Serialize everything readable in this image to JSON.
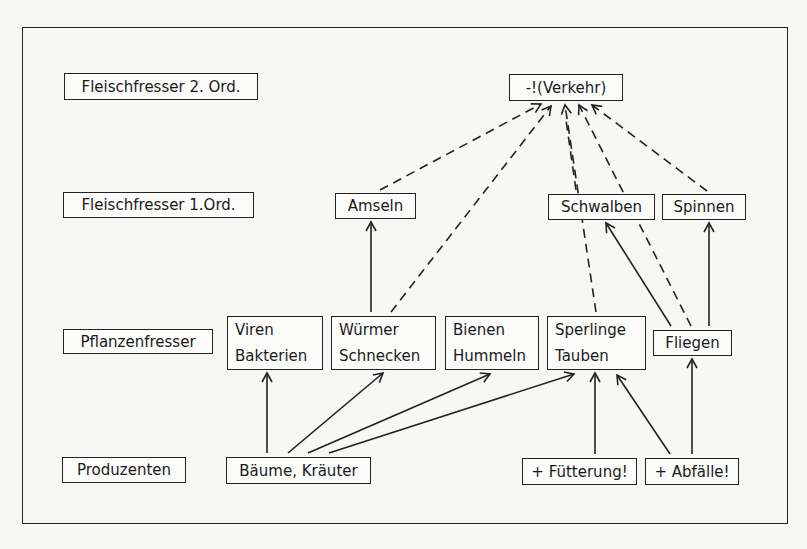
{
  "diagram": {
    "type": "food-web",
    "levels": [
      {
        "id": "lvl2",
        "label": "Fleischfresser 2. Ord."
      },
      {
        "id": "lvl1",
        "label": "Fleischfresser 1.Ord."
      },
      {
        "id": "lvl_herb",
        "label": "Pflanzenfresser"
      },
      {
        "id": "lvl_prod",
        "label": "Produzenten"
      }
    ],
    "nodes": {
      "verkehr": {
        "label": "-!(Verkehr)"
      },
      "amseln": {
        "label": "Amseln"
      },
      "schwalben": {
        "label": "Schwalben"
      },
      "spinnen": {
        "label": "Spinnen"
      },
      "viren": {
        "line1": "Viren",
        "line2": "Bakterien"
      },
      "wuermer": {
        "line1": "Würmer",
        "line2": "Schnecken"
      },
      "bienen": {
        "line1": "Bienen",
        "line2": "Hummeln"
      },
      "sperlinge": {
        "line1": "Sperlinge",
        "line2": "Tauben"
      },
      "fliegen": {
        "label": "Fliegen"
      },
      "baeume": {
        "label": "Bäume, Kräuter"
      },
      "fuetterung": {
        "label": "+ Fütterung!"
      },
      "abfaelle": {
        "label": "+ Abfälle!"
      }
    },
    "edges": [
      {
        "from": "baeume",
        "to": "viren",
        "style": "solid"
      },
      {
        "from": "baeume",
        "to": "wuermer",
        "style": "solid"
      },
      {
        "from": "baeume",
        "to": "bienen",
        "style": "solid"
      },
      {
        "from": "baeume",
        "to": "sperlinge",
        "style": "solid"
      },
      {
        "from": "fuetterung",
        "to": "sperlinge",
        "style": "solid"
      },
      {
        "from": "abfaelle",
        "to": "sperlinge",
        "style": "solid"
      },
      {
        "from": "abfaelle",
        "to": "fliegen",
        "style": "solid"
      },
      {
        "from": "wuermer",
        "to": "amseln",
        "style": "solid"
      },
      {
        "from": "fliegen",
        "to": "schwalben",
        "style": "solid"
      },
      {
        "from": "fliegen",
        "to": "spinnen",
        "style": "solid"
      },
      {
        "from": "amseln",
        "to": "verkehr",
        "style": "dashed"
      },
      {
        "from": "wuermer",
        "to": "verkehr",
        "style": "dashed"
      },
      {
        "from": "sperlinge",
        "to": "verkehr",
        "style": "dashed"
      },
      {
        "from": "fliegen",
        "to": "verkehr",
        "style": "dashed"
      },
      {
        "from": "spinnen",
        "to": "verkehr",
        "style": "dashed"
      }
    ]
  }
}
